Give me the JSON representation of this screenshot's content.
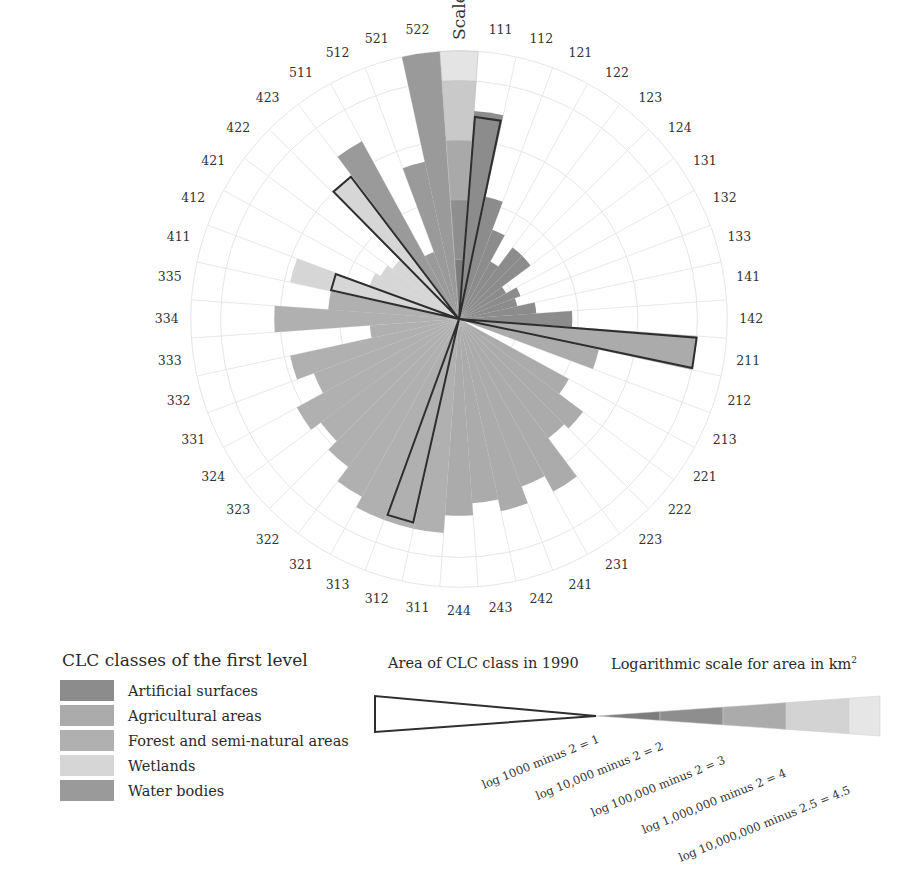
{
  "chart_data": {
    "type": "radial-bar",
    "title": "",
    "scale_label": "Scale",
    "value_description": "Logarithmic scale for area in km²: log(area) minus offset",
    "rings": [
      1,
      2,
      3,
      4,
      4.5
    ],
    "colors": {
      "Artificial surfaces": "#8c8c8c",
      "Agricultural areas": "#ababab",
      "Forest and semi-natural areas": "#b0b0b0",
      "Wetlands": "#d6d6d6",
      "Water bodies": "#9a9a9a"
    },
    "categories": [
      "111",
      "112",
      "121",
      "122",
      "123",
      "124",
      "131",
      "132",
      "133",
      "141",
      "142",
      "211",
      "212",
      "213",
      "221",
      "222",
      "223",
      "231",
      "241",
      "242",
      "243",
      "244",
      "311",
      "312",
      "313",
      "321",
      "322",
      "323",
      "324",
      "331",
      "332",
      "333",
      "334",
      "335",
      "411",
      "412",
      "421",
      "422",
      "423",
      "511",
      "512",
      "521",
      "522"
    ],
    "series": [
      {
        "name": "Area 2000 (filled bar)",
        "values": [
          3.5,
          2.1,
          1.6,
          1.1,
          1.5,
          1.5,
          0.9,
          1.1,
          1.0,
          1.3,
          1.9,
          4.0,
          2.4,
          0.0,
          2.1,
          2.6,
          2.5,
          3.3,
          3.0,
          3.3,
          3.1,
          3.3,
          3.6,
          3.6,
          3.6,
          3.4,
          3.1,
          2.9,
          3.1,
          2.6,
          2.9,
          1.5,
          3.1,
          2.2,
          2.9,
          1.6,
          1.5,
          1.4,
          3.0,
          3.4,
          1.2,
          2.7,
          4.5
        ]
      },
      {
        "name": "Area of CLC class in 1990 (outlined)",
        "values": [
          3.4,
          null,
          null,
          null,
          null,
          null,
          null,
          null,
          null,
          null,
          null,
          4.0,
          null,
          null,
          null,
          null,
          null,
          null,
          null,
          null,
          null,
          null,
          null,
          3.5,
          null,
          null,
          null,
          null,
          null,
          null,
          null,
          null,
          null,
          null,
          2.2,
          null,
          null,
          null,
          3.0,
          null,
          null,
          null,
          null
        ]
      }
    ],
    "group_of_category": [
      "Artificial surfaces",
      "Artificial surfaces",
      "Artificial surfaces",
      "Artificial surfaces",
      "Artificial surfaces",
      "Artificial surfaces",
      "Artificial surfaces",
      "Artificial surfaces",
      "Artificial surfaces",
      "Artificial surfaces",
      "Artificial surfaces",
      "Agricultural areas",
      "Agricultural areas",
      "Agricultural areas",
      "Agricultural areas",
      "Agricultural areas",
      "Agricultural areas",
      "Agricultural areas",
      "Agricultural areas",
      "Agricultural areas",
      "Agricultural areas",
      "Agricultural areas",
      "Forest and semi-natural areas",
      "Forest and semi-natural areas",
      "Forest and semi-natural areas",
      "Forest and semi-natural areas",
      "Forest and semi-natural areas",
      "Forest and semi-natural areas",
      "Forest and semi-natural areas",
      "Forest and semi-natural areas",
      "Forest and semi-natural areas",
      "Forest and semi-natural areas",
      "Forest and semi-natural areas",
      "Forest and semi-natural areas",
      "Wetlands",
      "Wetlands",
      "Wetlands",
      "Wetlands",
      "Wetlands",
      "Water bodies",
      "Water bodies",
      "Water bodies",
      "Water bodies"
    ],
    "scale_bar": {
      "segments": [
        1,
        2,
        3,
        4,
        4.5
      ],
      "tick_labels": [
        "log 1000 minus 2 = 1",
        "log 10,000 minus 2 = 2",
        "log 100,000 minus 2 = 3",
        "log 1,000,000 minus 2 = 4",
        "log 10,000,000 minus 2.5 = 4.5"
      ]
    }
  },
  "legend": {
    "title": "CLC classes of the first level",
    "items": [
      {
        "label": "Artificial surfaces",
        "color": "#8c8c8c"
      },
      {
        "label": "Agricultural areas",
        "color": "#ababab"
      },
      {
        "label": "Forest and semi-natural areas",
        "color": "#b0b0b0"
      },
      {
        "label": "Wetlands",
        "color": "#d6d6d6"
      },
      {
        "label": "Water bodies",
        "color": "#9a9a9a"
      }
    ]
  },
  "area_legend": {
    "title": "Area of CLC class in 1990",
    "log_title": "Logarithmic scale for area in km",
    "log_title_sup": "2"
  }
}
